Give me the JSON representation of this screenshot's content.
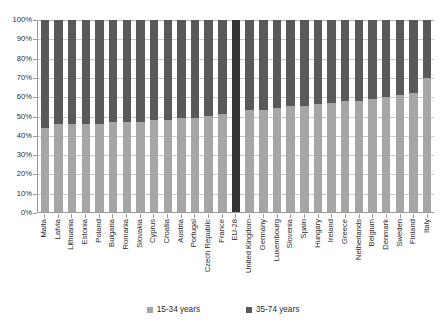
{
  "chart_data": {
    "type": "bar",
    "title": "",
    "xlabel": "",
    "ylabel": "",
    "stacked": true,
    "stacked_normalized": true,
    "grid": true,
    "legend_position": "bottom",
    "ylim": [
      0,
      100
    ],
    "ytick_labels": [
      "100%",
      "90%",
      "80%",
      "70%",
      "60%",
      "50%",
      "40%",
      "30%",
      "20%",
      "10%",
      "0%"
    ],
    "ytick_values": [
      100,
      90,
      80,
      70,
      60,
      50,
      40,
      30,
      20,
      10,
      0
    ],
    "categories": [
      "Malta",
      "Latvia",
      "Lithuania",
      "Estonia",
      "Poland",
      "Bulgaria",
      "Romania",
      "Slovakia",
      "Cyprus",
      "Croatia",
      "Austria",
      "Portugal",
      "Czech Republic",
      "France",
      "EU-28",
      "United Kingdom",
      "Germany",
      "Luxembourg",
      "Slovenia",
      "Spain",
      "Hungary",
      "Ireland",
      "Greece",
      "Netherlands",
      "Belgium",
      "Denmark",
      "Sweden",
      "Finland",
      "Italy"
    ],
    "series": [
      {
        "name": "15-34 years",
        "color": "#a6a6a6",
        "values": [
          44,
          46,
          46,
          46,
          46,
          47,
          47,
          47,
          48,
          48,
          49,
          49,
          50,
          51,
          52,
          53,
          53,
          54,
          55,
          55,
          56,
          57,
          58,
          58,
          59,
          60,
          61,
          62,
          70
        ]
      },
      {
        "name": "35-74 years",
        "color": "#595959",
        "values": [
          56,
          54,
          54,
          54,
          54,
          53,
          53,
          53,
          52,
          52,
          51,
          51,
          50,
          49,
          48,
          47,
          47,
          46,
          45,
          45,
          44,
          43,
          42,
          42,
          41,
          40,
          39,
          38,
          30
        ]
      }
    ],
    "highlight_category": "EU-28"
  },
  "legend": {
    "items": [
      {
        "label": "15-34 years",
        "swatch_name": "legend-swatch-15-34"
      },
      {
        "label": "35-74 years",
        "swatch_name": "legend-swatch-35-74"
      }
    ]
  },
  "colors": {
    "series_young": "#a6a6a6",
    "series_old": "#595959",
    "highlight": "#333333",
    "grid": "#c9c9c9",
    "axis": "#9a9a9a",
    "text": "#2b2b2b",
    "background": "#ffffff"
  }
}
